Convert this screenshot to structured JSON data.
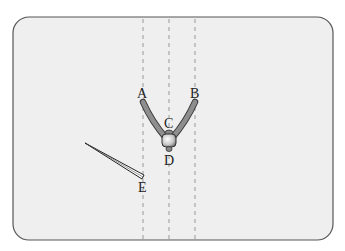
{
  "diagram": {
    "panel": {
      "x": 13,
      "y": 17,
      "width": 320,
      "height": 223,
      "radius": 16,
      "fill": "#efefef",
      "stroke": "#555555"
    },
    "dashed_lines": [
      {
        "x": 143
      },
      {
        "x": 169
      },
      {
        "x": 195
      }
    ],
    "labels": {
      "A": "A",
      "B": "B",
      "C": "C",
      "D": "D",
      "E": "E"
    },
    "compass": {
      "arm_color": "#8a8a8a",
      "joint_color": "#d0d0d0"
    },
    "pointer": {
      "from": [
        85,
        143
      ],
      "to": [
        143,
        178
      ]
    }
  }
}
